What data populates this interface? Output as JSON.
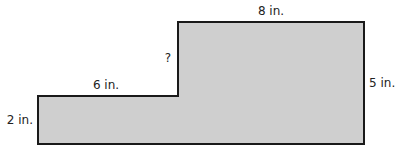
{
  "diagram": {
    "type": "composite-rectilinear-figure",
    "fill_color": "#cfcfcf",
    "stroke_color": "#1a1a1a",
    "labels": {
      "top": "8 in.",
      "right": "5 in.",
      "step_top": "6 in.",
      "left": "2 in.",
      "unknown_side": "?"
    },
    "dimensions": {
      "top_width_in": 8,
      "right_height_in": 5,
      "step_width_in": 6,
      "left_height_in": 2,
      "unknown_vertical_side": "?"
    }
  }
}
